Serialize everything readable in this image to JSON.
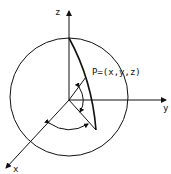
{
  "diagram": {
    "title": "",
    "axes": {
      "z": {
        "label": "z"
      },
      "y": {
        "label": "y"
      },
      "x": {
        "label": "x"
      }
    },
    "point": {
      "label": "P=(x,y,z)"
    },
    "elements": [
      "sphere-outline",
      "meridian-arc",
      "radius-to-P",
      "projection-line",
      "polar-angle-arc",
      "azimuth-angle-arc"
    ],
    "colors": {
      "stroke": "#111111",
      "background": "#ffffff"
    }
  }
}
